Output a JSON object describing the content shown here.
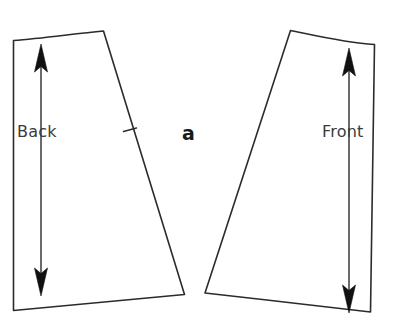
{
  "figure": {
    "caption_label": "a",
    "background_color": "#ffffff",
    "line_color": "#2b2b2b",
    "arrow_color": "#111111",
    "text_color": "#3b3b3b",
    "width": 396,
    "height": 328
  },
  "pieces": [
    {
      "id": "back-panel",
      "label": "Back",
      "label_x": 17,
      "label_y": 124,
      "outline_path": "M 13.5 40.5 L 13.5 310.5 C 70 305 130 300 184.5 294.5 L 103.5 31.0 C 72 34 42 38.5 13.5 40.5 Z",
      "has_notch": true,
      "notch_path": "M 123.5 131.5 L 136.5 128.0",
      "grainline": {
        "orientation": "vertical",
        "double_headed": true,
        "x": 41,
        "top_y": 44,
        "bottom_y": 296
      }
    },
    {
      "id": "front-panel",
      "label": "Front",
      "label_x": 322,
      "label_y": 124,
      "outline_path": "M 290.5 30.5 L 205.0 293.0 C 260 299 318 306 370.5 312.0 L 374.5 44.5 C 346 43 317 36 290.5 30.5 Z",
      "has_notch": false,
      "notch_path": "",
      "grainline": {
        "orientation": "vertical",
        "double_headed": true,
        "x": 349,
        "top_y": 48,
        "bottom_y": 313
      }
    }
  ]
}
